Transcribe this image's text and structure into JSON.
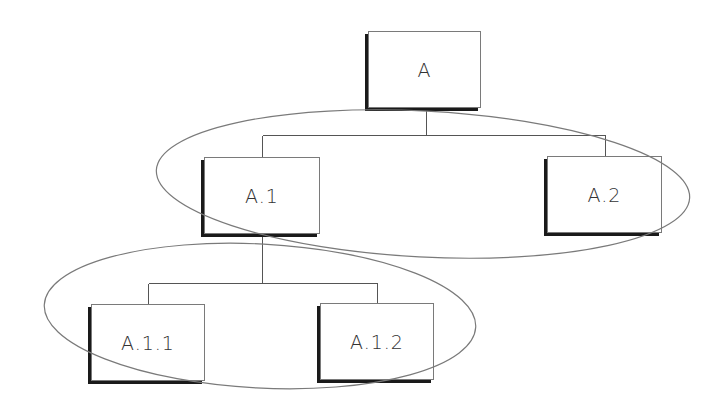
{
  "diagram": {
    "type": "hierarchy-tree",
    "colors": {
      "background": "#ffffff",
      "node_border": "#7a7a7a",
      "node_shadow": "#1a1a1a",
      "connector": "#555555",
      "ellipse": "#7a7a7a",
      "label": "#333333"
    },
    "nodes": [
      {
        "id": "A",
        "label": "A",
        "x": 368,
        "y": 31,
        "w": 113,
        "h": 77
      },
      {
        "id": "A.1",
        "label": "A.1",
        "x": 204,
        "y": 157,
        "w": 116,
        "h": 77
      },
      {
        "id": "A.2",
        "label": "A.2",
        "x": 547,
        "y": 156,
        "w": 115,
        "h": 77
      },
      {
        "id": "A.1.1",
        "label": "A.1.1",
        "x": 91,
        "y": 304,
        "w": 114,
        "h": 77
      },
      {
        "id": "A.1.2",
        "label": "A.1.2",
        "x": 320,
        "y": 303,
        "w": 114,
        "h": 77
      }
    ],
    "edges": [
      {
        "from": "A",
        "to": "A.1"
      },
      {
        "from": "A",
        "to": "A.2"
      },
      {
        "from": "A.1",
        "to": "A.1.1"
      },
      {
        "from": "A.1",
        "to": "A.1.2"
      }
    ],
    "groups": [
      {
        "name": "level-2-group",
        "members": [
          "A.1",
          "A.2"
        ],
        "cx": 423,
        "cy": 184,
        "rx": 267,
        "ry": 73,
        "rotate": 3
      },
      {
        "name": "level-3-group",
        "members": [
          "A.1.1",
          "A.1.2"
        ],
        "cx": 260,
        "cy": 316,
        "rx": 216,
        "ry": 72,
        "rotate": 3
      }
    ]
  }
}
